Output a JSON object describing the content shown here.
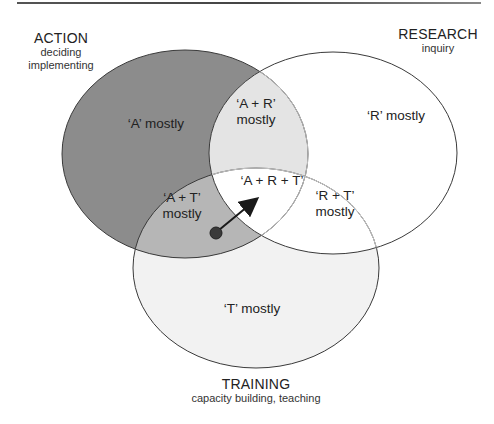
{
  "diagram": {
    "circles": [
      {
        "key": "action",
        "title": "ACTION",
        "subtitle_lines": [
          "deciding",
          "implementing"
        ],
        "fill": "#8c8c8c"
      },
      {
        "key": "research",
        "title": "RESEARCH",
        "subtitle_lines": [
          "inquiry"
        ],
        "fill": "#ffffff"
      },
      {
        "key": "training",
        "title": "TRAINING",
        "subtitle_lines": [
          "capacity building, teaching"
        ],
        "fill": "#f2f2f2"
      }
    ],
    "overlap_fills": {
      "action_research": "#e4e4e4",
      "action_training": "#b6b6b6",
      "research_training": "#ffffff",
      "all": "#ffffff"
    },
    "regions": {
      "a_mostly": "‘A’ mostly",
      "r_mostly": "‘R’ mostly",
      "t_mostly": "‘T’ mostly",
      "ar_line1": "‘A + R’",
      "ar_line2": "mostly",
      "at_line1": "‘A + T’",
      "at_line2": "mostly",
      "rt_line1": "‘R + T’",
      "rt_line2": "mostly",
      "art": "‘A + R + T’"
    },
    "arrow": {
      "from": "A + T region (dot)",
      "to": "A + R + T region",
      "color": "#1a1a1a",
      "dot_color": "#3a3a3a"
    }
  }
}
